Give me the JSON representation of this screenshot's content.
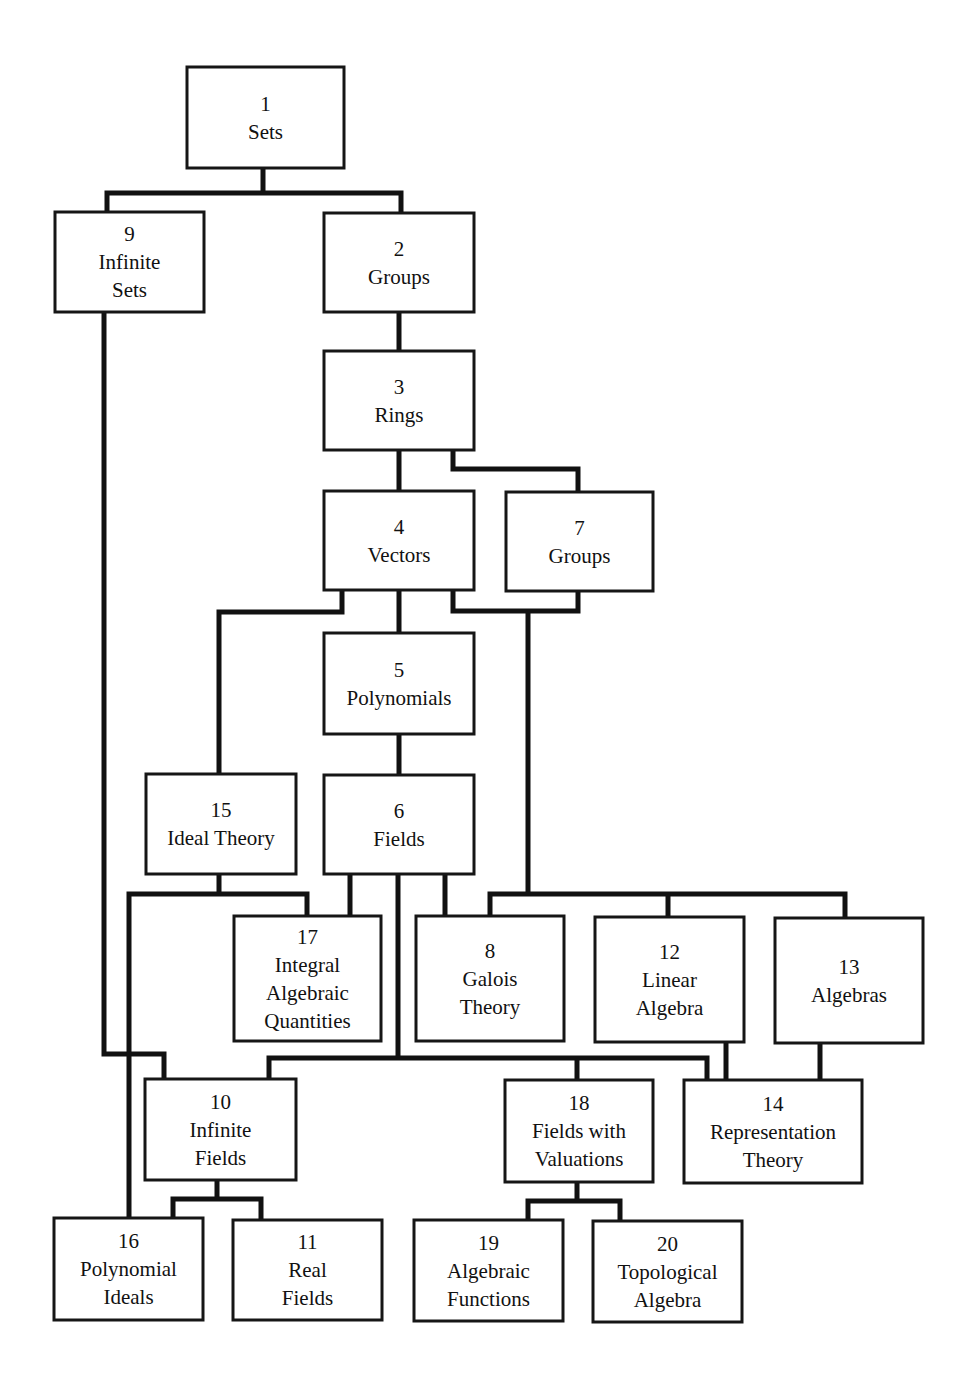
{
  "diagram": {
    "title": "",
    "colors": {
      "line": "#111111",
      "box_border": "#161616",
      "background": "#ffffff",
      "text": "#111111"
    },
    "nodes": [
      {
        "id": "1",
        "lines": [
          "1",
          "Sets"
        ],
        "box": [
          187,
          67,
          157,
          101
        ]
      },
      {
        "id": "9",
        "lines": [
          "9",
          "Infinite",
          "Sets"
        ],
        "box": [
          55,
          212,
          149,
          100
        ]
      },
      {
        "id": "2",
        "lines": [
          "2",
          "Groups"
        ],
        "box": [
          324,
          213,
          150,
          99
        ]
      },
      {
        "id": "3",
        "lines": [
          "3",
          "Rings"
        ],
        "box": [
          324,
          351,
          150,
          99
        ]
      },
      {
        "id": "4",
        "lines": [
          "4",
          "Vectors"
        ],
        "box": [
          324,
          491,
          150,
          99
        ]
      },
      {
        "id": "7",
        "lines": [
          "7",
          "Groups"
        ],
        "box": [
          506,
          492,
          147,
          99
        ]
      },
      {
        "id": "5",
        "lines": [
          "5",
          "Polynomials"
        ],
        "box": [
          324,
          633,
          150,
          101
        ]
      },
      {
        "id": "15",
        "lines": [
          "15",
          "Ideal Theory"
        ],
        "box": [
          146,
          774,
          150,
          100
        ]
      },
      {
        "id": "6",
        "lines": [
          "6",
          "Fields"
        ],
        "box": [
          324,
          775,
          150,
          99
        ]
      },
      {
        "id": "17",
        "lines": [
          "17",
          "Integral",
          "Algebraic",
          "Quantities"
        ],
        "box": [
          234,
          916,
          147,
          125
        ]
      },
      {
        "id": "8",
        "lines": [
          "8",
          "Galois",
          "Theory"
        ],
        "box": [
          416,
          916,
          148,
          125
        ]
      },
      {
        "id": "12",
        "lines": [
          "12",
          "Linear",
          "Algebra"
        ],
        "box": [
          595,
          917,
          149,
          125
        ]
      },
      {
        "id": "13",
        "lines": [
          "13",
          "Algebras"
        ],
        "box": [
          775,
          918,
          148,
          125
        ]
      },
      {
        "id": "10",
        "lines": [
          "10",
          "Infinite",
          "Fields"
        ],
        "box": [
          145,
          1079,
          151,
          101
        ]
      },
      {
        "id": "18",
        "lines": [
          "18",
          "Fields with",
          "Valuations"
        ],
        "box": [
          505,
          1080,
          148,
          102
        ]
      },
      {
        "id": "14",
        "lines": [
          "14",
          "Representation",
          "Theory"
        ],
        "box": [
          684,
          1080,
          178,
          103
        ]
      },
      {
        "id": "16",
        "lines": [
          "16",
          "Polynomial",
          "Ideals"
        ],
        "box": [
          54,
          1218,
          149,
          102
        ]
      },
      {
        "id": "11",
        "lines": [
          "11",
          "Real",
          "Fields"
        ],
        "box": [
          233,
          1220,
          149,
          100
        ]
      },
      {
        "id": "19",
        "lines": [
          "19",
          "Algebraic",
          "Functions"
        ],
        "box": [
          414,
          1220,
          149,
          101
        ]
      },
      {
        "id": "20",
        "lines": [
          "20",
          "Topological",
          "Algebra"
        ],
        "box": [
          593,
          1221,
          149,
          101
        ]
      }
    ],
    "edges": [
      {
        "from": "1",
        "to": [
          "9",
          "2"
        ],
        "path": "M263,168 L263,193 M107,212 L107,193 L401,193 L401,213"
      },
      {
        "from": "9",
        "to": [
          "10"
        ],
        "path": "M104,312 L104,1054 L164,1054 L164,1079"
      },
      {
        "from": "2",
        "to": [
          "3"
        ],
        "path": "M399,312 L399,351"
      },
      {
        "from": "3",
        "to": [
          "4",
          "7"
        ],
        "path": "M399,450 L399,491 M453,450 L453,469 L578,469 L578,492"
      },
      {
        "from": "4",
        "to": [
          "5",
          "15"
        ],
        "path": "M399,590 L399,633 M342,590 L342,612 L219,612 L219,774"
      },
      {
        "from": "4",
        "to": [
          "8",
          "12",
          "13"
        ],
        "path": "M453,590 L453,611 L578,611 L578,591 M528,611 L528,894 L490,894 L490,916 M528,894 L845,894 L845,918 M668,894 L668,917"
      },
      {
        "from": "5",
        "to": [
          "6"
        ],
        "path": "M399,734 L399,775"
      },
      {
        "from": "15",
        "to": [
          "17",
          "16"
        ],
        "path": "M219,874 L219,894 L307,894 L307,916 M219,894 L129,894 L129,1218"
      },
      {
        "from": "6",
        "to": [
          "17",
          "8"
        ],
        "path": "M350,874 L350,916 M445,874 L445,916"
      },
      {
        "from": "6",
        "to": [
          "10",
          "18",
          "14"
        ],
        "path": "M398,874 L398,1058 M269,1079 L269,1058 L707,1058 L707,1080 M577,1058 L577,1080"
      },
      {
        "from": "12",
        "to": [
          "14"
        ],
        "path": "M726,1042 L726,1080"
      },
      {
        "from": "13",
        "to": [
          "14"
        ],
        "path": "M820,1043 L820,1080"
      },
      {
        "from": "10",
        "to": [
          "16",
          "11"
        ],
        "path": "M217,1180 L217,1199 L173,1199 L173,1218 M217,1199 L261,1199 L261,1220"
      },
      {
        "from": "18",
        "to": [
          "19",
          "20"
        ],
        "path": "M577,1182 L577,1201 L528,1201 L528,1220 M577,1201 L620,1201 L620,1221"
      }
    ]
  }
}
